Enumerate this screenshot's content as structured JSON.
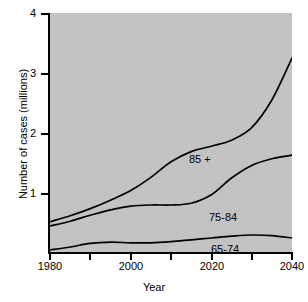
{
  "chart_data": {
    "type": "line",
    "title": "",
    "xlabel": "Year",
    "ylabel": "Number of cases (millions)",
    "xlim": [
      1980,
      2040
    ],
    "ylim": [
      0,
      4
    ],
    "xticks": [
      1980,
      1990,
      2000,
      2010,
      2020,
      2030,
      2040
    ],
    "xtick_labels": [
      "1980",
      "",
      "2000",
      "",
      "2020",
      "",
      "2040"
    ],
    "yticks": [
      1,
      2,
      3,
      4
    ],
    "ytick_labels": [
      "1",
      "2",
      "3",
      "4"
    ],
    "grid": false,
    "legend": "inline-annotations",
    "plot_background": "#c3c3c3",
    "line_color": "#000000",
    "x": [
      1980,
      1985,
      1990,
      1995,
      2000,
      2005,
      2010,
      2015,
      2020,
      2025,
      2030,
      2035,
      2040
    ],
    "series": [
      {
        "name": "85+",
        "label": "85 +",
        "values": [
          0.52,
          0.62,
          0.74,
          0.88,
          1.04,
          1.26,
          1.52,
          1.69,
          1.78,
          1.88,
          2.09,
          2.55,
          3.25
        ]
      },
      {
        "name": "75-84",
        "label": "75-84",
        "values": [
          0.45,
          0.53,
          0.63,
          0.72,
          0.78,
          0.8,
          0.8,
          0.83,
          0.97,
          1.25,
          1.46,
          1.57,
          1.63
        ]
      },
      {
        "name": "65-74",
        "label": "65-74",
        "values": [
          0.05,
          0.1,
          0.16,
          0.18,
          0.17,
          0.17,
          0.19,
          0.22,
          0.25,
          0.28,
          0.3,
          0.29,
          0.25
        ]
      }
    ]
  },
  "axes": {
    "y_title": "Number of cases (millions)",
    "x_title": "Year",
    "y_labels": [
      {
        "value": 4,
        "text": "4"
      },
      {
        "value": 3,
        "text": "3"
      },
      {
        "value": 2,
        "text": "2"
      },
      {
        "value": 1,
        "text": "1"
      }
    ],
    "x_labels": [
      {
        "value": 1980,
        "text": "1980"
      },
      {
        "value": 2000,
        "text": "2000"
      },
      {
        "value": 2020,
        "text": "2020"
      },
      {
        "value": 2040,
        "text": "2040"
      }
    ]
  },
  "annotations": {
    "series_85plus": "85 +",
    "series_7584": "75-84",
    "series_6574": "65-74"
  }
}
